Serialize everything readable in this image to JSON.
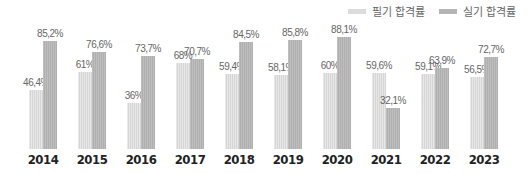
{
  "legend": {
    "written_label": "필기 합격률",
    "practical_label": "실기 합격률"
  },
  "colors": {
    "written": "#dcdcdc",
    "practical": "#b5b5b5"
  },
  "chart_data": {
    "type": "bar",
    "title": "",
    "xlabel": "",
    "ylabel": "",
    "ylim": [
      0,
      100
    ],
    "grid": false,
    "legend_position": "top-right",
    "categories": [
      "2014",
      "2015",
      "2016",
      "2017",
      "2018",
      "2019",
      "2020",
      "2021",
      "2022",
      "2023"
    ],
    "series": [
      {
        "name": "필기 합격률",
        "values": [
          46.4,
          61,
          36,
          68,
          59.4,
          58.1,
          60,
          59.6,
          59.1,
          56.5
        ],
        "labels": [
          "46,4%",
          "61%",
          "36%",
          "68%",
          "59,4%",
          "58,1%",
          "60%",
          "59,6%",
          "59,1%",
          "56,5%"
        ]
      },
      {
        "name": "실기 합격률",
        "values": [
          85.2,
          76.6,
          73.7,
          70.7,
          84.5,
          85.8,
          88.1,
          32.1,
          63.9,
          72.7
        ],
        "labels": [
          "85,2%",
          "76,6%",
          "73,7%",
          "70,7%",
          "84,5%",
          "85,8%",
          "88,1%",
          "32,1%",
          "63,9%",
          "72,7%"
        ]
      }
    ]
  }
}
